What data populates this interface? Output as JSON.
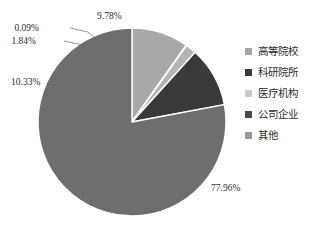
{
  "chart_data": {
    "type": "pie",
    "title": "",
    "legend_position": "right",
    "categories": [
      "高等院校",
      "科研院所",
      "医疗机构",
      "公司企业",
      "其他"
    ],
    "values": [
      9.78,
      0.09,
      1.84,
      10.33,
      77.96
    ],
    "value_labels": [
      "9.78%",
      "0.09%",
      "1.84%",
      "10.33%",
      "77.96%"
    ],
    "colors": [
      "#a8a8a8",
      "#c9c9c9",
      "#b4b4b4",
      "#3a3a3a",
      "#6e6e6e"
    ],
    "units": "percent",
    "start_angle_deg": 0,
    "direction": "clockwise"
  },
  "legend": {
    "items": [
      {
        "label": "高等院校",
        "color": "#a8a8a8"
      },
      {
        "label": "科研院所",
        "color": "#3a3a3a"
      },
      {
        "label": "医疗机构",
        "color": "#c9c9c9"
      },
      {
        "label": "公司企业",
        "color": "#4a4a4a"
      },
      {
        "label": "其他",
        "color": "#9a9a9a"
      }
    ]
  },
  "labels": {
    "top": "9.78%",
    "upper_left_small": "0.09%",
    "upper_left_second": "1.84%",
    "left": "10.33%",
    "bottom_right": "77.96%"
  }
}
